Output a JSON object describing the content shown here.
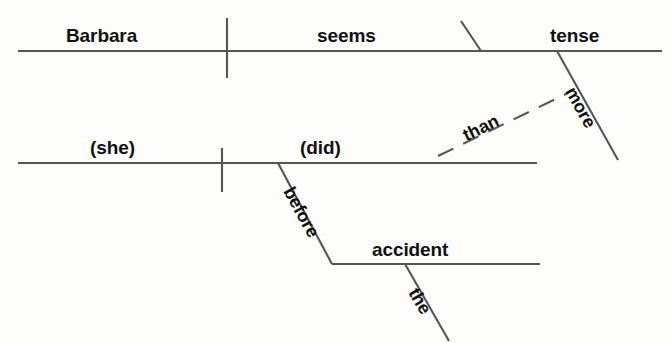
{
  "diagram": {
    "type": "reed-kellogg-sentence-diagram",
    "sentence": "Barbara seems more tense than (she) (did) before the accident.",
    "line_color": "#555555",
    "text_color": "#111111",
    "background_color": "#fdfdfc",
    "clauses": [
      {
        "name": "main-clause",
        "baseline": {
          "x1": 18,
          "y": 51,
          "x2": 662
        },
        "subject": {
          "label": "Barbara",
          "x": 66,
          "y": 46
        },
        "verb": {
          "label": "seems",
          "x": 317,
          "y": 46
        },
        "complement": {
          "label": "tense",
          "x": 550,
          "y": 46
        },
        "subject_divider": {
          "x": 227,
          "y1": 18,
          "y2": 78
        },
        "complement_slash": {
          "x1": 462,
          "y1": 22,
          "x2": 481,
          "y2": 51
        },
        "modifiers": [
          {
            "label": "more",
            "x": 570,
            "y": 72,
            "attaches_to": "tense"
          }
        ]
      },
      {
        "name": "subordinate-clause",
        "baseline": {
          "x1": 18,
          "y": 163,
          "x2": 537
        },
        "subject": {
          "label": "(she)",
          "x": 90,
          "y": 158
        },
        "verb": {
          "label": "(did)",
          "x": 300,
          "y": 158
        },
        "subject_divider": {
          "x": 222,
          "y1": 148,
          "y2": 192
        },
        "connector": {
          "label": "than",
          "style": "dashed",
          "x1": 440,
          "y1": 155,
          "x2": 568,
          "y2": 93
        },
        "modifiers": [
          {
            "label": "before",
            "x": 293,
            "y": 182,
            "attaches_to": "(did)"
          }
        ]
      },
      {
        "name": "prepositional-object",
        "baseline": {
          "x1": 332,
          "y": 264,
          "x2": 540
        },
        "object": {
          "label": "accident",
          "x": 372,
          "y": 259
        },
        "modifiers": [
          {
            "label": "the",
            "x": 416,
            "y": 282,
            "attaches_to": "accident"
          }
        ]
      }
    ],
    "labels": {
      "barbara": "Barbara",
      "seems": "seems",
      "tense": "tense",
      "more": "more",
      "than": "than",
      "she": "(she)",
      "did": "(did)",
      "before": "before",
      "accident": "accident",
      "the": "the"
    }
  }
}
